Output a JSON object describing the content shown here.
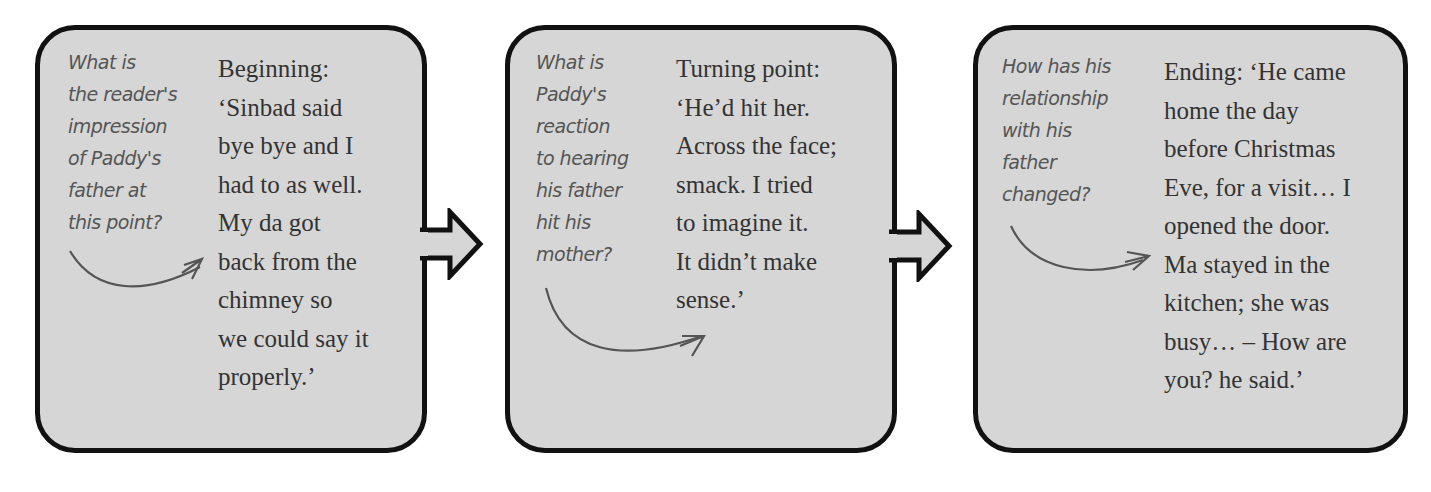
{
  "panels": [
    {
      "question_lines": [
        "What is",
        "the reader's",
        "impression",
        "of Paddy's",
        "father at",
        "this point?"
      ],
      "quote_lines": [
        "Beginning:",
        "‘Sinbad said",
        "bye bye and I",
        "had to as well.",
        "My da got",
        "back from the",
        "chimney so",
        "we could say it",
        "properly.’"
      ]
    },
    {
      "question_lines": [
        "What is",
        "Paddy's",
        "reaction",
        "to hearing",
        "his father",
        "hit his",
        "mother?"
      ],
      "quote_lines": [
        "Turning point:",
        "‘He’d hit her.",
        "Across the face;",
        "smack. I tried",
        "to imagine it.",
        "It didn’t make",
        "sense.’"
      ]
    },
    {
      "question_lines": [
        "How has his",
        "relationship",
        "with his",
        "father",
        "changed?"
      ],
      "quote_lines": [
        "Ending: ‘He came",
        "home the day",
        "before Christmas",
        "Eve, for a visit… I",
        "opened the door.",
        "Ma stayed in the",
        "kitchen; she was",
        "busy… – How are",
        "you? he said.’"
      ]
    }
  ],
  "connectors": [
    "right-arrow",
    "right-arrow"
  ],
  "colors": {
    "box_fill": "#d6d6d6",
    "border": "#111111",
    "question_text": "#555555",
    "quote_text": "#333333"
  }
}
